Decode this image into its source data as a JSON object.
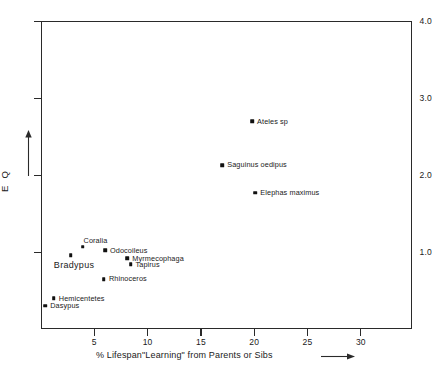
{
  "chart_data": {
    "type": "scatter",
    "title": "",
    "xlabel": "% Lifespan\"Learning\" from Parents or Sibs",
    "ylabel": "E Q",
    "xlim": [
      0,
      34.8
    ],
    "ylim": [
      0,
      4.0
    ],
    "grid": false,
    "legend": "none",
    "xticks": [
      "5",
      "10",
      "15",
      "20",
      "25",
      "30"
    ],
    "xtick_values": [
      5,
      10,
      15,
      20,
      25,
      30
    ],
    "yticks": [
      "4.0",
      "3.0",
      "2.0",
      "1.0"
    ],
    "ytick_values": [
      4.0,
      3.0,
      2.0,
      1.0
    ],
    "x_axis_arrow": "right-arrow",
    "y_axis_arrow": "up-arrow",
    "points": [
      {
        "label": "Ateles sp",
        "x": 19.8,
        "y": 2.7,
        "label_pos": "right",
        "size": "small"
      },
      {
        "label": "Saguinus oedipus",
        "x": 17.0,
        "y": 2.13,
        "label_pos": "right",
        "size": "small"
      },
      {
        "label": "Elephas maximus",
        "x": 20.1,
        "y": 1.77,
        "label_pos": "right",
        "size": "small"
      },
      {
        "label": "Coralia",
        "x": 3.9,
        "y": 1.07,
        "label_pos": "above",
        "size": "small"
      },
      {
        "label": "Odocoileus",
        "x": 6.0,
        "y": 1.02,
        "label_pos": "right",
        "size": "small"
      },
      {
        "label": "Bradypus",
        "x": 2.8,
        "y": 0.96,
        "label_pos": "below",
        "size": "big"
      },
      {
        "label": "Myrmecophaga",
        "x": 8.1,
        "y": 0.92,
        "label_pos": "right",
        "size": "small"
      },
      {
        "label": "Tapirus",
        "x": 8.4,
        "y": 0.84,
        "label_pos": "right",
        "size": "small"
      },
      {
        "label": "Rhinoceros",
        "x": 5.9,
        "y": 0.65,
        "label_pos": "right",
        "size": "small"
      },
      {
        "label": "Hemicentetes",
        "x": 1.2,
        "y": 0.4,
        "label_pos": "right",
        "size": "small"
      },
      {
        "label": "Dasypus",
        "x": 0.4,
        "y": 0.3,
        "label_pos": "right",
        "size": "small"
      }
    ]
  },
  "colors": {
    "axis": "#2a2a2a",
    "marker": "#111111",
    "text": "#1a1a1a",
    "background": "#ffffff"
  }
}
